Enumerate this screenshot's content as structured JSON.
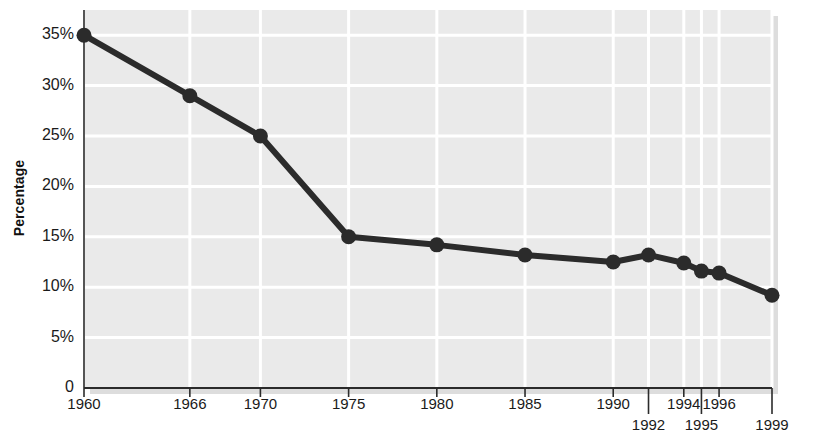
{
  "chart_data": {
    "type": "line",
    "title": "",
    "subtitle": "",
    "xlabel": "",
    "ylabel": "Percentage",
    "x": [
      1960,
      1966,
      1970,
      1975,
      1980,
      1985,
      1990,
      1992,
      1994,
      1995,
      1996,
      1999
    ],
    "values": [
      35,
      29,
      25,
      15,
      14.2,
      13.2,
      12.5,
      13.2,
      12.4,
      11.6,
      11.4,
      9.2
    ],
    "series": [
      {
        "name": "Percentage",
        "values": [
          35,
          29,
          25,
          15,
          14.2,
          13.2,
          12.5,
          13.2,
          12.4,
          11.6,
          11.4,
          9.2
        ]
      }
    ],
    "categories": [
      "1960",
      "1966",
      "1970",
      "1975",
      "1980",
      "1985",
      "1990",
      "1992",
      "1994",
      "1995",
      "1996",
      "1999"
    ],
    "xlim": [
      1960,
      1999
    ],
    "ylim": [
      0,
      37.5
    ],
    "ytick_values": [
      0,
      5,
      10,
      15,
      20,
      25,
      30,
      35
    ],
    "ytick_labels": [
      "0",
      "5%",
      "10%",
      "15%",
      "20%",
      "25%",
      "30%",
      "35%"
    ],
    "xtick_labels": [
      "1960",
      "1966",
      "1970",
      "1975",
      "1980",
      "1985",
      "1990",
      "1992",
      "1994",
      "1995",
      "1996",
      "1999"
    ],
    "xtick_rows": [
      0,
      0,
      0,
      0,
      0,
      0,
      0,
      1,
      0,
      1,
      0,
      1
    ],
    "grid": "horizontal-and-vertical",
    "legend": "none",
    "colors": {
      "line": "#2b2b2b",
      "marker": "#2b2b2b",
      "plot_background": "#eaeaea",
      "gridline": "#ffffff",
      "axis": "#555555",
      "text": "#1a1a1a"
    }
  }
}
